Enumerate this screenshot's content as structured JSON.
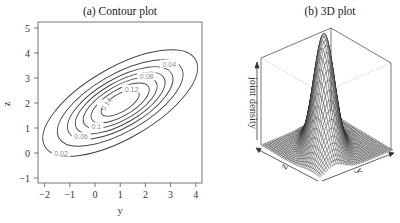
{
  "chart_data": [
    {
      "type": "contour",
      "title": "(a) Contour plot",
      "xlabel": "y",
      "ylabel": "z",
      "xlim": [
        -2.2,
        4.3
      ],
      "ylim": [
        -1.2,
        5.2
      ],
      "xticks": [
        -2,
        -1,
        0,
        1,
        2,
        3,
        4
      ],
      "yticks": [
        -1,
        0,
        1,
        2,
        3,
        4,
        5
      ],
      "grid": false,
      "center": [
        1,
        2
      ],
      "rotation_deg": 30,
      "levels": [
        {
          "value": 0.02,
          "label": "0.02",
          "rx": 3.45,
          "ry": 1.42
        },
        {
          "value": 0.04,
          "label": "0.04",
          "rx": 2.8,
          "ry": 1.15
        },
        {
          "value": 0.06,
          "label": "0.06",
          "rx": 2.35,
          "ry": 0.97
        },
        {
          "value": 0.08,
          "label": "0.08",
          "rx": 2.0,
          "ry": 0.82
        },
        {
          "value": 0.1,
          "label": "0.1",
          "rx": 1.65,
          "ry": 0.68
        },
        {
          "value": 0.12,
          "label": "0.12",
          "rx": 1.3,
          "ry": 0.53
        },
        {
          "value": 0.14,
          "label": "0.14",
          "rx": 0.85,
          "ry": 0.35
        }
      ],
      "label_positions": [
        {
          "label": "0.02",
          "x": -1.35,
          "y": 0.0
        },
        {
          "label": "0.04",
          "x": 2.95,
          "y": 3.55
        },
        {
          "label": "0.06",
          "x": -0.55,
          "y": 0.65
        },
        {
          "label": "0.08",
          "x": 2.05,
          "y": 3.05
        },
        {
          "label": "0.1",
          "x": 0.05,
          "y": 1.05
        },
        {
          "label": "0.12",
          "x": 1.45,
          "y": 2.55
        },
        {
          "label": "0.14",
          "x": 0.45,
          "y": 1.95
        }
      ]
    },
    {
      "type": "surface3d",
      "title": "(b) 3D plot",
      "xlabel": "y",
      "ylabel": "z",
      "zlabel": "joint density",
      "description": "Bivariate normal joint density surface with a single peak, mesh wireframe"
    }
  ]
}
